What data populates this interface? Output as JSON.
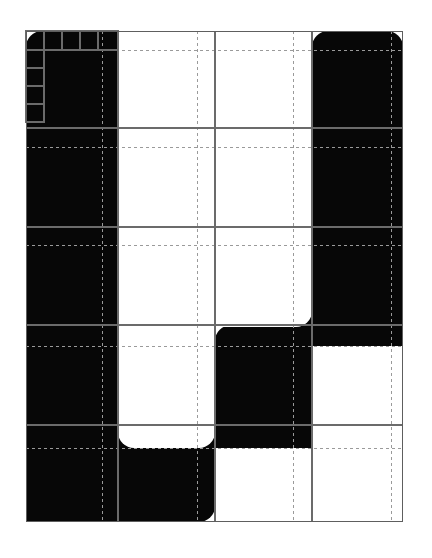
{
  "figure": {
    "kind": "modular-grid-plan",
    "canvas": {
      "width": 432,
      "height": 558
    },
    "colors": {
      "background": "#ffffff",
      "fill": "#070707",
      "solid_line": "#6b6b6b",
      "dashed_line": "#9a9a9a",
      "frame_line": "#5e5e5e"
    },
    "frame": {
      "x": 26,
      "y": 31,
      "width": 377,
      "height": 491
    },
    "grid": {
      "vertical_solid": [
        26,
        118,
        215,
        312,
        403
      ],
      "vertical_dashed": [
        102,
        197,
        293,
        391
      ],
      "horizontal_solid": [
        31,
        128,
        227,
        325,
        425,
        522
      ],
      "horizontal_dashed": [
        50,
        147,
        245,
        346,
        448
      ]
    },
    "corner_module": {
      "label": "nested-corner-cells",
      "top_cells_x": [
        26,
        44,
        62,
        80,
        98,
        118
      ],
      "left_cells_y": [
        31,
        50,
        68,
        86,
        104,
        122
      ],
      "top_row": {
        "y": 31,
        "height": 19
      },
      "left_col": {
        "x": 26,
        "width": 18
      }
    },
    "blocks": [
      {
        "name": "block-left-tall",
        "x": 26,
        "y": 31,
        "w": 92,
        "h": 491,
        "r": [
          16,
          0,
          0,
          16
        ]
      },
      {
        "name": "block-left-inner",
        "x": 102,
        "y": 31,
        "w": 95,
        "h": 296,
        "r": [
          0,
          16,
          0,
          0
        ]
      },
      {
        "name": "block-right-tall",
        "x": 312,
        "y": 31,
        "w": 91,
        "h": 315,
        "r": [
          16,
          16,
          0,
          0
        ]
      },
      {
        "name": "block-center-mid",
        "x": 215,
        "y": 325,
        "w": 97,
        "h": 123,
        "r": [
          16,
          0,
          0,
          0
        ]
      },
      {
        "name": "block-center-bridge",
        "x": 293,
        "y": 285,
        "w": 110,
        "h": 61,
        "r": [
          0,
          0,
          16,
          0
        ]
      },
      {
        "name": "block-bottom-strip",
        "x": 102,
        "y": 425,
        "w": 113,
        "h": 97,
        "r": [
          0,
          0,
          16,
          0
        ]
      },
      {
        "name": "block-bottom-left-foot",
        "x": 26,
        "y": 425,
        "w": 92,
        "h": 97,
        "r": [
          0,
          0,
          16,
          0
        ]
      }
    ],
    "white_cutouts": [
      {
        "name": "cutout-upper-center",
        "x": 118,
        "y": 31,
        "w": 194,
        "h": 296,
        "r": [
          0,
          0,
          16,
          0
        ]
      },
      {
        "name": "cutout-mid-left",
        "x": 118,
        "y": 325,
        "w": 97,
        "h": 123,
        "r": [
          0,
          0,
          16,
          16
        ]
      },
      {
        "name": "cutout-right-lower",
        "x": 312,
        "y": 346,
        "w": 91,
        "h": 176,
        "r": [
          16,
          0,
          0,
          0
        ]
      },
      {
        "name": "cutout-bottom-right",
        "x": 215,
        "y": 448,
        "w": 188,
        "h": 74,
        "r": [
          16,
          0,
          0,
          0
        ]
      },
      {
        "name": "cutout-mid-right",
        "x": 215,
        "y": 245,
        "w": 97,
        "h": 80,
        "r": [
          0,
          0,
          16,
          0
        ]
      }
    ]
  }
}
